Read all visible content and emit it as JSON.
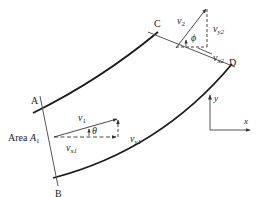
{
  "diagram": {
    "sections": {
      "A": "A",
      "B": "B",
      "C": "C",
      "D": "D"
    },
    "inlet": {
      "area_label": "Area ",
      "area_symbol": "A",
      "area_sub": "1",
      "velocity": {
        "sym": "v",
        "sub": "1"
      },
      "vx": {
        "sym": "v",
        "sub": "x1"
      },
      "vy": {
        "sym": "v",
        "sub": "y1"
      },
      "angle": "θ"
    },
    "outlet": {
      "velocity": {
        "sym": "v",
        "sub": "2"
      },
      "vx": {
        "sym": "v",
        "sub": "x2"
      },
      "vy": {
        "sym": "v",
        "sub": "y2"
      },
      "angle": "ϕ"
    },
    "axes": {
      "x": "x",
      "y": "y"
    },
    "colors": {
      "wall": "#1a1a1a",
      "line": "#555555",
      "text": "#222222"
    }
  }
}
